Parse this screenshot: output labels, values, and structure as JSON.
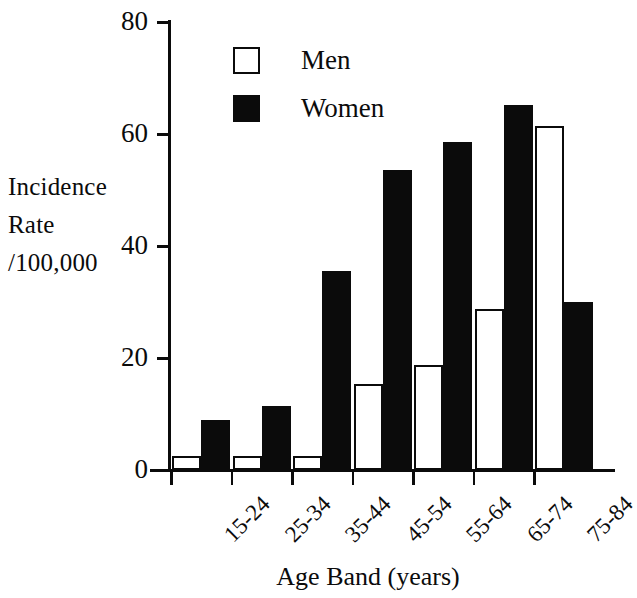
{
  "chart_data": {
    "type": "bar",
    "title": "",
    "xlabel": "Age Band (years)",
    "ylabel": "Incidence Rate /100,000",
    "ylabel_lines": [
      "Incidence",
      "Rate",
      "/100,000"
    ],
    "categories": [
      "15-24",
      "25-34",
      "35-44",
      "45-54",
      "55-64",
      "65-74",
      "75-84"
    ],
    "series": [
      {
        "name": "Men",
        "color": "#ffffff",
        "edgecolor": "#0b0b0b",
        "values": [
          2.5,
          2.5,
          2.5,
          15.3,
          18.8,
          28.7,
          61.5
        ]
      },
      {
        "name": "Women",
        "color": "#0b0b0b",
        "edgecolor": "#0b0b0b",
        "values": [
          9.0,
          11.5,
          35.5,
          53.5,
          58.5,
          65.2,
          30.0
        ]
      }
    ],
    "ylim": [
      0,
      80
    ],
    "yticks": [
      0,
      20,
      40,
      60,
      80
    ],
    "ytick_labels": [
      "0",
      "20",
      "40",
      "60",
      "80"
    ],
    "grid": false,
    "legend_position": "upper left inside",
    "legend_entries": [
      "Men",
      "Women"
    ],
    "xtick_label_rotation": -45,
    "note": "last Women bar (75-84) is clipped by the right edge of the figure"
  }
}
